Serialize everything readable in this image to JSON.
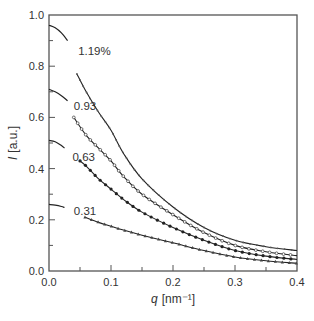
{
  "chart_data": {
    "type": "line",
    "title": "",
    "xlabel": "q [nm⁻¹]",
    "xlabel_var": "q",
    "xlabel_unit": "[nm⁻¹]",
    "ylabel": "I [a.u.]",
    "ylabel_var": "I",
    "ylabel_unit": "[a.u.]",
    "xlim": [
      0.0,
      0.4
    ],
    "ylim": [
      0.0,
      1.0
    ],
    "xticks": [
      "0.0",
      "0.1",
      "0.2",
      "0.3",
      "0.4"
    ],
    "yticks": [
      "0.0",
      "0.2",
      "0.4",
      "0.6",
      "0.8",
      "1.0"
    ],
    "grid": false,
    "legend": "inline labels",
    "series": [
      {
        "name": "1.19%",
        "label": "1.19%",
        "label_pos": [
          0.047,
          0.86
        ],
        "guinier": {
          "x": [
            0.0,
            0.01,
            0.02,
            0.03
          ],
          "y": [
            0.96,
            0.95,
            0.93,
            0.9
          ]
        },
        "x": [
          0.045,
          0.06,
          0.08,
          0.1,
          0.12,
          0.15,
          0.2,
          0.25,
          0.3,
          0.35,
          0.4
        ],
        "y": [
          0.77,
          0.7,
          0.62,
          0.55,
          0.46,
          0.36,
          0.25,
          0.17,
          0.12,
          0.095,
          0.08
        ]
      },
      {
        "name": "0.93",
        "label": "0.93",
        "label_pos": [
          0.04,
          0.645
        ],
        "guinier": {
          "x": [
            0.0,
            0.01,
            0.02,
            0.03
          ],
          "y": [
            0.71,
            0.7,
            0.685,
            0.665
          ]
        },
        "x": [
          0.04,
          0.06,
          0.08,
          0.1,
          0.12,
          0.15,
          0.2,
          0.25,
          0.3,
          0.35,
          0.4
        ],
        "y": [
          0.6,
          0.53,
          0.48,
          0.43,
          0.37,
          0.3,
          0.22,
          0.15,
          0.1,
          0.075,
          0.06
        ]
      },
      {
        "name": "0.63",
        "label": "0.63",
        "label_pos": [
          0.038,
          0.445
        ],
        "guinier": {
          "x": [
            0.0,
            0.01,
            0.02,
            0.025
          ],
          "y": [
            0.51,
            0.505,
            0.49,
            0.48
          ]
        },
        "x": [
          0.05,
          0.06,
          0.08,
          0.1,
          0.12,
          0.15,
          0.2,
          0.25,
          0.3,
          0.35,
          0.4
        ],
        "y": [
          0.43,
          0.41,
          0.36,
          0.32,
          0.28,
          0.23,
          0.17,
          0.12,
          0.08,
          0.058,
          0.045
        ]
      },
      {
        "name": "0.31",
        "label": "0.31",
        "label_pos": [
          0.04,
          0.235
        ],
        "guinier": {
          "x": [
            0.0,
            0.01,
            0.02,
            0.025
          ],
          "y": [
            0.26,
            0.257,
            0.252,
            0.248
          ]
        },
        "x": [
          0.058,
          0.08,
          0.1,
          0.12,
          0.15,
          0.2,
          0.25,
          0.3,
          0.35,
          0.4
        ],
        "y": [
          0.21,
          0.19,
          0.175,
          0.16,
          0.14,
          0.11,
          0.08,
          0.055,
          0.04,
          0.03
        ]
      }
    ]
  }
}
